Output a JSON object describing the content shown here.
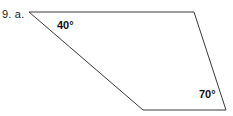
{
  "figure": {
    "problem_label": "9. a.",
    "stroke_color": "#3a3a3a",
    "fill_color": "#ffffff",
    "background_color": "#ffffff",
    "stroke_width": 1,
    "shape_type": "quadrilateral",
    "vertices": [
      {
        "name": "top-left",
        "x": 29,
        "y": 12
      },
      {
        "name": "top-right",
        "x": 194,
        "y": 12
      },
      {
        "name": "bottom-right",
        "x": 226,
        "y": 110
      },
      {
        "name": "bottom-left",
        "x": 143,
        "y": 110
      }
    ],
    "polygon_points": "29,12 194,12 226,110 143,110",
    "angles": [
      {
        "name": "angle-top-left",
        "value": "40°",
        "at_vertex": "top-left"
      },
      {
        "name": "angle-bottom-right",
        "value": "70°",
        "at_vertex": "bottom-right"
      }
    ]
  }
}
